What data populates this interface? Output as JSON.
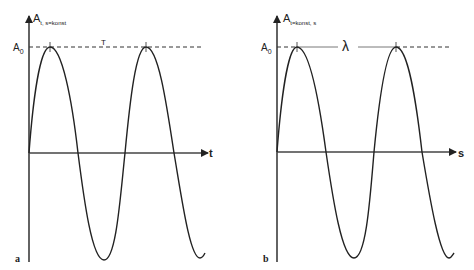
{
  "panels": [
    {
      "id": "a",
      "panel_label": "a",
      "y_axis_label": "A",
      "y_axis_subscript": "t, s=konst",
      "x_axis_label": "t",
      "amplitude_label": "A",
      "amplitude_subscript": "0",
      "period_label": "T"
    },
    {
      "id": "b",
      "panel_label": "b",
      "y_axis_label": "A",
      "y_axis_subscript": "t=konst, s",
      "x_axis_label": "s",
      "amplitude_label": "A",
      "amplitude_subscript": "0",
      "period_label": "λ"
    }
  ],
  "colors": {
    "line": "#222222",
    "background": "#ffffff"
  }
}
